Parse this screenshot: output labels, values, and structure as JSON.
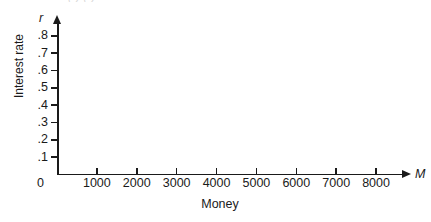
{
  "figure": {
    "clipped_top_text": "( )  ( )",
    "background_color": "#ffffff",
    "axis_color": "#1a1a1a"
  },
  "chart_data": {
    "type": "line",
    "title": "",
    "subtitle": "",
    "xlabel": "Money",
    "ylabel": "Interest rate",
    "x_axis_variable": "M",
    "y_axis_variable": "r",
    "origin_label": "0",
    "xlim": [
      0,
      8700
    ],
    "ylim": [
      0,
      0.88
    ],
    "x_ticks": [
      1000,
      2000,
      3000,
      4000,
      5000,
      6000,
      7000,
      8000
    ],
    "x_tick_labels": [
      "1000",
      "2000",
      "3000",
      "4000",
      "5000",
      "6000",
      "7000",
      "8000"
    ],
    "y_ticks": [
      0.8,
      0.7,
      0.6,
      0.5,
      0.4,
      0.3,
      0.2,
      0.1
    ],
    "y_tick_labels": [
      ".8",
      ".7",
      ".6",
      ".5",
      ".4",
      ".3",
      ".2",
      ".1"
    ],
    "grid": false,
    "legend": null,
    "series": [],
    "annotations": [],
    "note": "Blank axes template with no plotted data"
  }
}
